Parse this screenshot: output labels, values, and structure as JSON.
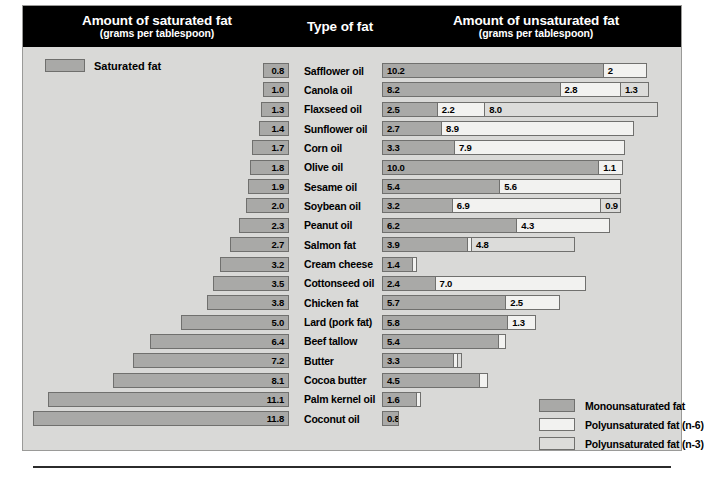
{
  "header": {
    "saturated_title": "Amount of saturated fat",
    "saturated_subtitle": "(grams per tablespoon)",
    "type_title": "Type of fat",
    "unsaturated_title": "Amount of unsaturated fat",
    "unsaturated_subtitle": "(grams per tablespoon)"
  },
  "saturated_key_label": "Saturated fat",
  "legend": {
    "items": [
      {
        "label": "Monounsaturated fat",
        "swatch": "mono",
        "color": "#a9a9a7"
      },
      {
        "label": "Polyunsaturated fat (n-6)",
        "swatch": "n6",
        "color": "#f2f2f0"
      },
      {
        "label": "Polyunsaturated fat (n-3)",
        "swatch": "n3",
        "color": "#dcdcda"
      }
    ]
  },
  "chart_data": {
    "type": "bar",
    "subtitle": "grams per tablespoon",
    "xlabel": "grams per tablespoon",
    "ylabel": "Type of fat",
    "orientation": "horizontal-diverging",
    "units": "grams per tablespoon",
    "grid": false,
    "legend_position": "bottom-right",
    "px_per_gram": 21.7,
    "categories": [
      "Safflower oil",
      "Canola oil",
      "Flaxseed oil",
      "Sunflower oil",
      "Corn oil",
      "Olive oil",
      "Sesame oil",
      "Soybean oil",
      "Peanut oil",
      "Salmon fat",
      "Cream cheese",
      "Cottonseed oil",
      "Chicken fat",
      "Lard (pork fat)",
      "Beef tallow",
      "Butter",
      "Cocoa butter",
      "Palm kernel oil",
      "Coconut oil"
    ],
    "series": [
      {
        "name": "Saturated fat",
        "color": "#a9a9a7",
        "values": [
          0.8,
          1.0,
          1.3,
          1.4,
          1.7,
          1.8,
          1.9,
          2.0,
          2.3,
          2.7,
          3.2,
          3.5,
          3.8,
          5.0,
          6.4,
          7.2,
          8.1,
          11.1,
          11.8
        ]
      },
      {
        "name": "Monounsaturated fat",
        "color": "#a9a9a7",
        "values": [
          10.2,
          8.2,
          2.5,
          2.7,
          3.3,
          10.0,
          5.4,
          3.2,
          6.2,
          3.9,
          1.4,
          2.4,
          5.7,
          5.8,
          5.4,
          3.3,
          4.5,
          1.6,
          0.8
        ]
      },
      {
        "name": "Polyunsaturated fat (n-6)",
        "color": "#f2f2f0",
        "values": [
          2.0,
          2.8,
          2.2,
          8.9,
          7.9,
          1.1,
          5.6,
          6.9,
          4.3,
          0.2,
          0.2,
          7.0,
          2.5,
          1.3,
          0.3,
          0.2,
          0.4,
          0.2,
          0.0
        ]
      },
      {
        "name": "Polyunsaturated fat (n-3)",
        "color": "#dcdcda",
        "values": [
          0.0,
          1.3,
          8.0,
          0.0,
          0.0,
          0.0,
          0.0,
          0.9,
          0.0,
          4.8,
          0.0,
          0.0,
          0.0,
          0.0,
          0.0,
          0.2,
          0.0,
          0.0,
          0.0
        ]
      }
    ]
  },
  "rows": [
    {
      "label": "Safflower oil",
      "sat": "0.8",
      "sat_v": 0.8,
      "segs": [
        {
          "t": "mono",
          "v": 10.2,
          "txt": "10.2"
        },
        {
          "t": "n6",
          "v": 2.0,
          "txt": "2"
        }
      ]
    },
    {
      "label": "Canola oil",
      "sat": "1.0",
      "sat_v": 1.0,
      "segs": [
        {
          "t": "mono",
          "v": 8.2,
          "txt": "8.2"
        },
        {
          "t": "n6",
          "v": 2.8,
          "txt": "2.8"
        },
        {
          "t": "n3",
          "v": 1.3,
          "txt": "1.3"
        }
      ]
    },
    {
      "label": "Flaxseed oil",
      "sat": "1.3",
      "sat_v": 1.3,
      "segs": [
        {
          "t": "mono",
          "v": 2.5,
          "txt": "2.5"
        },
        {
          "t": "n6",
          "v": 2.2,
          "txt": "2.2"
        },
        {
          "t": "n3",
          "v": 8.0,
          "txt": "8.0"
        }
      ]
    },
    {
      "label": "Sunflower oil",
      "sat": "1.4",
      "sat_v": 1.4,
      "segs": [
        {
          "t": "mono",
          "v": 2.7,
          "txt": "2.7"
        },
        {
          "t": "n6",
          "v": 8.9,
          "txt": "8.9"
        }
      ]
    },
    {
      "label": "Corn oil",
      "sat": "1.7",
      "sat_v": 1.7,
      "segs": [
        {
          "t": "mono",
          "v": 3.3,
          "txt": "3.3"
        },
        {
          "t": "n6",
          "v": 7.9,
          "txt": "7.9"
        }
      ]
    },
    {
      "label": "Olive oil",
      "sat": "1.8",
      "sat_v": 1.8,
      "segs": [
        {
          "t": "mono",
          "v": 10.0,
          "txt": "10.0"
        },
        {
          "t": "n6",
          "v": 1.1,
          "txt": "1.1"
        }
      ]
    },
    {
      "label": "Sesame oil",
      "sat": "1.9",
      "sat_v": 1.9,
      "segs": [
        {
          "t": "mono",
          "v": 5.4,
          "txt": "5.4"
        },
        {
          "t": "n6",
          "v": 5.6,
          "txt": "5.6"
        }
      ]
    },
    {
      "label": "Soybean oil",
      "sat": "2.0",
      "sat_v": 2.0,
      "segs": [
        {
          "t": "mono",
          "v": 3.2,
          "txt": "3.2"
        },
        {
          "t": "n6",
          "v": 6.9,
          "txt": "6.9"
        },
        {
          "t": "n3",
          "v": 0.9,
          "txt": "0.9"
        }
      ]
    },
    {
      "label": "Peanut oil",
      "sat": "2.3",
      "sat_v": 2.3,
      "segs": [
        {
          "t": "mono",
          "v": 6.2,
          "txt": "6.2"
        },
        {
          "t": "n6",
          "v": 4.3,
          "txt": "4.3"
        }
      ]
    },
    {
      "label": "Salmon fat",
      "sat": "2.7",
      "sat_v": 2.7,
      "segs": [
        {
          "t": "mono",
          "v": 3.9,
          "txt": "3.9"
        },
        {
          "t": "n6",
          "v": 0.2,
          "txt": ""
        },
        {
          "t": "n3",
          "v": 4.8,
          "txt": "4.8"
        }
      ]
    },
    {
      "label": "Cream cheese",
      "sat": "3.2",
      "sat_v": 3.2,
      "segs": [
        {
          "t": "mono",
          "v": 1.4,
          "txt": "1.4"
        },
        {
          "t": "n6",
          "v": 0.2,
          "txt": ""
        }
      ]
    },
    {
      "label": "Cottonseed oil",
      "sat": "3.5",
      "sat_v": 3.5,
      "segs": [
        {
          "t": "mono",
          "v": 2.4,
          "txt": "2.4"
        },
        {
          "t": "n6",
          "v": 7.0,
          "txt": "7.0"
        }
      ]
    },
    {
      "label": "Chicken fat",
      "sat": "3.8",
      "sat_v": 3.8,
      "segs": [
        {
          "t": "mono",
          "v": 5.7,
          "txt": "5.7"
        },
        {
          "t": "n6",
          "v": 2.5,
          "txt": "2.5"
        }
      ]
    },
    {
      "label": "Lard (pork fat)",
      "sat": "5.0",
      "sat_v": 5.0,
      "segs": [
        {
          "t": "mono",
          "v": 5.8,
          "txt": "5.8"
        },
        {
          "t": "n6",
          "v": 1.3,
          "txt": "1.3"
        }
      ]
    },
    {
      "label": "Beef tallow",
      "sat": "6.4",
      "sat_v": 6.4,
      "segs": [
        {
          "t": "mono",
          "v": 5.4,
          "txt": "5.4"
        },
        {
          "t": "n6",
          "v": 0.3,
          "txt": ""
        }
      ]
    },
    {
      "label": "Butter",
      "sat": "7.2",
      "sat_v": 7.2,
      "segs": [
        {
          "t": "mono",
          "v": 3.3,
          "txt": "3.3"
        },
        {
          "t": "n6",
          "v": 0.2,
          "txt": ""
        },
        {
          "t": "n3",
          "v": 0.2,
          "txt": ""
        }
      ]
    },
    {
      "label": "Cocoa butter",
      "sat": "8.1",
      "sat_v": 8.1,
      "segs": [
        {
          "t": "mono",
          "v": 4.5,
          "txt": "4.5"
        },
        {
          "t": "n6",
          "v": 0.4,
          "txt": ""
        }
      ]
    },
    {
      "label": "Palm kernel oil",
      "sat": "11.1",
      "sat_v": 11.1,
      "segs": [
        {
          "t": "mono",
          "v": 1.6,
          "txt": "1.6"
        },
        {
          "t": "n6",
          "v": 0.2,
          "txt": ""
        }
      ]
    },
    {
      "label": "Coconut oil",
      "sat": "11.8",
      "sat_v": 11.8,
      "segs": [
        {
          "t": "mono",
          "v": 0.8,
          "txt": "0.8"
        }
      ]
    }
  ]
}
